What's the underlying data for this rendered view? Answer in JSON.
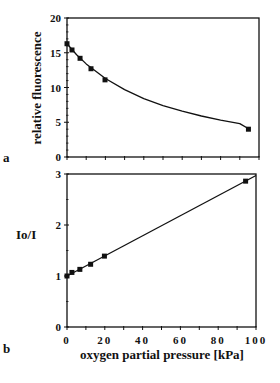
{
  "chart_data": [
    {
      "type": "line",
      "panel_label": "a",
      "title": "",
      "xlabel": "oxygen partial pressure [kPa]",
      "ylabel": "relative fluorescence",
      "xlim": [
        0,
        100
      ],
      "ylim": [
        0,
        20
      ],
      "yticks": [
        0,
        5,
        10,
        15,
        20
      ],
      "xticks": [
        0,
        20,
        40,
        60,
        80,
        100
      ],
      "grid": false,
      "series": [
        {
          "name": "measured",
          "style": "square-markers",
          "x": [
            0,
            2.6,
            6.8,
            12.5,
            19.8,
            94.5
          ],
          "y": [
            16.3,
            15.4,
            14.2,
            12.7,
            11.1,
            4.0
          ]
        },
        {
          "name": "fit",
          "style": "smooth-curve",
          "x": [
            0,
            5,
            10,
            20,
            30,
            40,
            50,
            60,
            70,
            80,
            90,
            95
          ],
          "y": [
            16.3,
            14.7,
            13.4,
            11.3,
            9.7,
            8.4,
            7.4,
            6.6,
            5.9,
            5.3,
            4.8,
            4.0
          ]
        }
      ]
    },
    {
      "type": "line",
      "panel_label": "b",
      "title": "",
      "xlabel": "oxygen partial pressure [kPa]",
      "ylabel": "Io/I",
      "xlim": [
        0,
        100
      ],
      "ylim": [
        0,
        3
      ],
      "yticks": [
        0,
        1,
        2,
        3
      ],
      "xticks": [
        0,
        20,
        40,
        60,
        80,
        100
      ],
      "grid": false,
      "series": [
        {
          "name": "measured",
          "style": "square-markers",
          "x": [
            0,
            2.6,
            6.8,
            12.5,
            19.8,
            94.5
          ],
          "y": [
            1.0,
            1.07,
            1.13,
            1.23,
            1.39,
            2.86
          ]
        },
        {
          "name": "linear fit",
          "style": "line",
          "x": [
            0,
            100
          ],
          "y": [
            1.0,
            2.97
          ]
        }
      ]
    }
  ],
  "labels": {
    "panel_a": "a",
    "panel_b": "b",
    "ylabel_a": "relative fluorescence",
    "ylabel_b": "Io/I",
    "xlabel": "oxygen partial pressure [kPa]"
  },
  "colors": {
    "ink": "#111111",
    "background": "#ffffff"
  }
}
